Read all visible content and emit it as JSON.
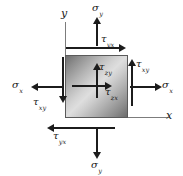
{
  "figure": {
    "background_color": "#ffffff",
    "element_fill": "gradient-gray",
    "stroke_color": "#1c1c1c",
    "axis_color": "#7c7c7c"
  },
  "axes": {
    "y_label": "y",
    "x_label": "x"
  },
  "stresses": {
    "sigma_y_top": {
      "symbol": "σ",
      "sub": "y",
      "direction": "up"
    },
    "sigma_y_bottom": {
      "symbol": "σ",
      "sub": "y",
      "direction": "down"
    },
    "sigma_x_left": {
      "symbol": "σ",
      "sub": "x",
      "direction": "left"
    },
    "sigma_x_right": {
      "symbol": "σ",
      "sub": "x",
      "direction": "right"
    },
    "tau_yx_top": {
      "symbol": "τ",
      "sub": "yx",
      "direction": "right"
    },
    "tau_yx_bottom": {
      "symbol": "τ",
      "sub": "yx",
      "direction": "left"
    },
    "tau_xy_left": {
      "symbol": "τ",
      "sub": "xy",
      "direction": "down"
    },
    "tau_xy_right": {
      "symbol": "τ",
      "sub": "xy",
      "direction": "up"
    },
    "tau_zy_center": {
      "symbol": "τ",
      "sub": "zy",
      "direction": "up"
    },
    "tau_zx_center": {
      "symbol": "τ",
      "sub": "zx",
      "direction": "right"
    }
  }
}
